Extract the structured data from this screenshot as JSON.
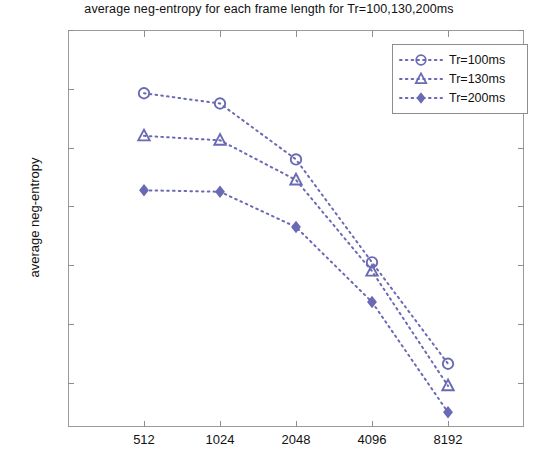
{
  "chart_data": {
    "type": "line",
    "title": "average neg-entropy for each frame length for Tr=100,130,200ms",
    "xlabel": "",
    "ylabel": "average neg-entropy",
    "categories": [
      "512",
      "1024",
      "2048",
      "4096",
      "8192"
    ],
    "xtick_labels": [
      "512",
      "1024",
      "2048",
      "4096",
      "8192"
    ],
    "ytick_labels": [
      "1.4",
      "1.6",
      "1.8",
      "2",
      "2.2",
      "2.4",
      "2.6"
    ],
    "ytick_values": [
      1.4,
      1.6,
      1.8,
      2.0,
      2.2,
      2.4,
      2.6
    ],
    "ylim": [
      1.25,
      2.6
    ],
    "xlim": [
      0,
      6
    ],
    "grid": false,
    "legend_position": "top-right",
    "line_style": "dotted",
    "series": [
      {
        "name": "Tr=100ms",
        "marker": "circle",
        "color": "#6a6ab4",
        "values": [
          2.385,
          2.35,
          2.16,
          1.81,
          1.465
        ]
      },
      {
        "name": "Tr=130ms",
        "marker": "triangle",
        "color": "#6a6ab4",
        "values": [
          2.24,
          2.225,
          2.09,
          1.78,
          1.39
        ]
      },
      {
        "name": "Tr=200ms",
        "marker": "diamond",
        "color": "#6a6ab4",
        "values": [
          2.055,
          2.05,
          1.93,
          1.675,
          1.3
        ]
      }
    ]
  },
  "legend": {
    "items": [
      {
        "label": "Tr=100ms",
        "marker": "circle"
      },
      {
        "label": "Tr=130ms",
        "marker": "triangle"
      },
      {
        "label": "Tr=200ms",
        "marker": "diamond"
      }
    ]
  },
  "colors": {
    "series": "#6a6ab4",
    "axis": "#9a9a9a",
    "text": "#111111",
    "background": "#ffffff"
  }
}
